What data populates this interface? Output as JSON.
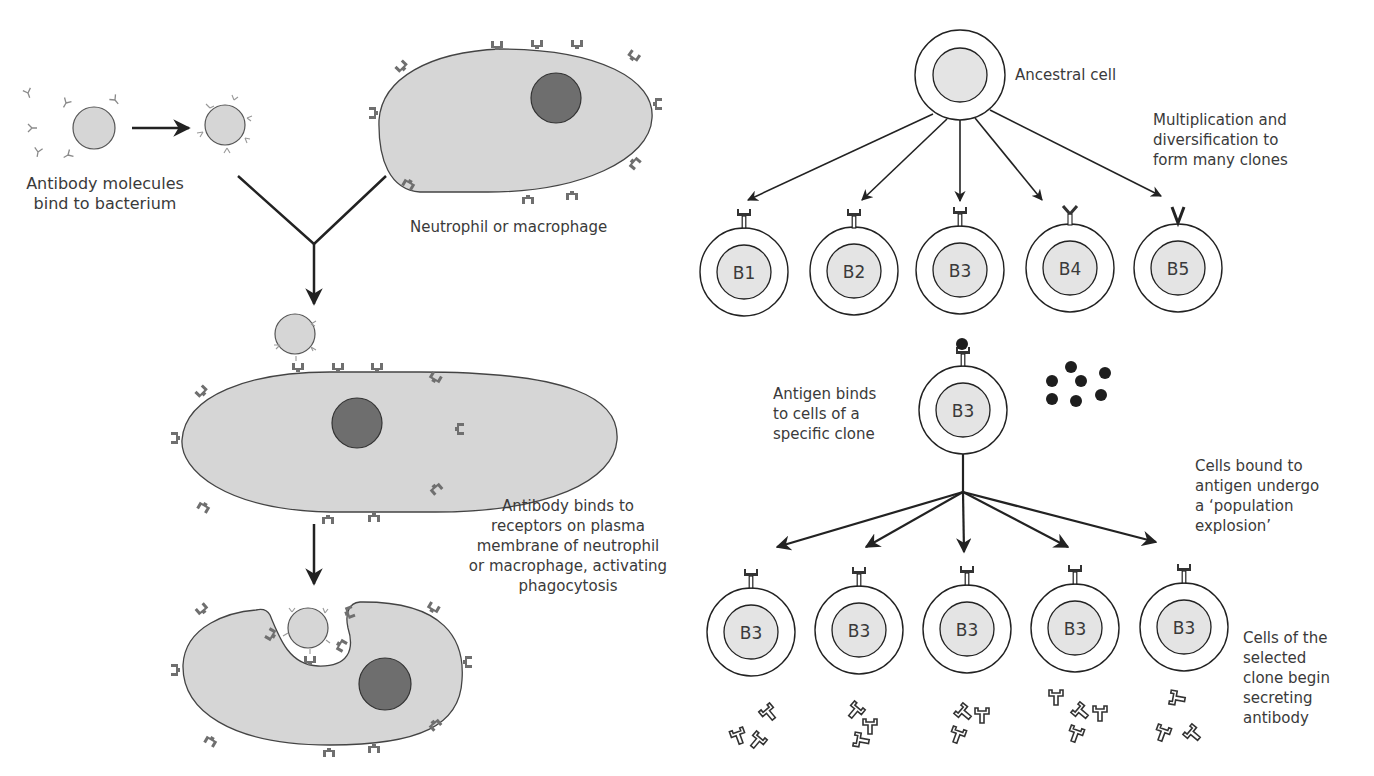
{
  "left_panel": {
    "labels": {
      "antibody_bind": "Antibody molecules\nbind to bacterium",
      "phagocyte": "Neutrophil or macrophage",
      "receptor_binding": "Antibody binds to\nreceptors on plasma\nmembrane of neutrophil\nor macrophage, activating\nphagocytosis"
    }
  },
  "right_panel": {
    "labels": {
      "ancestral": "Ancestral cell",
      "multiplication": "Multiplication and\ndiversification to\nform many clones",
      "antigen_binds": "Antigen binds\nto cells of a\nspecific clone",
      "explosion": "Cells bound to\nantigen undergo\na ‘population\nexplosion’",
      "secreting": "Cells of the\nselected\nclone begin\nsecreting\nantibody"
    },
    "clones": [
      "B1",
      "B2",
      "B3",
      "B4",
      "B5"
    ],
    "selected_clone": "B3",
    "expanded_clones": [
      "B3",
      "B3",
      "B3",
      "B3",
      "B3"
    ]
  },
  "colors": {
    "cell_fill": "#d6d6d6",
    "nucleus_fill": "#6e6e6e",
    "receptor": "#707070",
    "line": "#222222",
    "antigen": "#1e1e1e"
  }
}
